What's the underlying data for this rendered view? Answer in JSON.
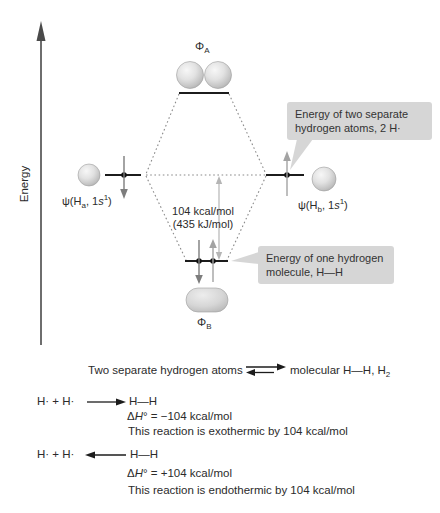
{
  "figure": {
    "axis_label": "Energy",
    "antibonding": {
      "symbol": "Φ",
      "sub": "A"
    },
    "bonding": {
      "symbol": "Φ",
      "sub": "B"
    },
    "atom_a": {
      "pre": "ψ(H",
      "sub": "a",
      "mid": ", 1",
      "s": "s",
      "sup": "1",
      "post": ")"
    },
    "atom_b": {
      "pre": "ψ(H",
      "sub": "b",
      "mid": ", 1",
      "s": "s",
      "sup": "1",
      "post": ")"
    },
    "gap_label": {
      "line1": "104 kcal/mol",
      "line2": "(435 kJ/mol)"
    },
    "callout_atoms": {
      "line1": "Energy of two separate",
      "line2": "hydrogen atoms, 2 H·"
    },
    "callout_molecule": {
      "line1": "Energy of one hydrogen",
      "line2": "molecule, H—H"
    }
  },
  "equilibrium": {
    "left": "Two separate hydrogen atoms",
    "right_main": "molecular H—H, H",
    "right_sub": "2"
  },
  "reaction_forward": {
    "reactants": "H· + H·",
    "product": "H—H",
    "dh_delta": "Δ",
    "dh_h": "H",
    "dh_deg": "°",
    "dh_rest": " = −104 kcal/mol",
    "note": "This reaction is exothermic by 104 kcal/mol"
  },
  "reaction_reverse": {
    "reactants": "H· + H·",
    "product": "H—H",
    "dh_delta": "Δ",
    "dh_h": "H",
    "dh_deg": "°",
    "dh_rest": " = +104 kcal/mol",
    "note": "This reaction is endothermic by 104 kcal/mol"
  },
  "colors": {
    "level_line": "#1c1c1c",
    "dotted_line": "#8a8a8a",
    "electron_arrow_dark": "#7d7d7d",
    "electron_arrow_light": "#a3a3a3",
    "gap_arrow": "#b5b5b5",
    "callout_bg": "#d6d6d6",
    "axis": "#4a4a4a",
    "sphere_fill": "#d8d8d8",
    "text": "#2b2b2b"
  }
}
